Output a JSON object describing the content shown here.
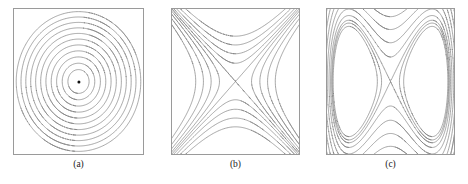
{
  "figure": {
    "width": 468,
    "height": 184,
    "background": "#ffffff",
    "contour_color": "#808080",
    "frame_color": "#9a9a9a",
    "caption_color": "#1a1a1a",
    "marker_color": "#111111",
    "line_width": 0.7
  },
  "panels": [
    {
      "id": "a",
      "caption": "(a)",
      "name": "panel-a-center-contours",
      "x": 13,
      "y": 8,
      "width": 131,
      "height": 147,
      "caption_y": 160,
      "field_type": "center",
      "description": "concentric closed contours around an elliptic fixed point (minimum)",
      "marker": {
        "visible": true,
        "cx": 0.5,
        "cy": 0.5,
        "r": 1.6
      },
      "levels": [
        0.055,
        0.13,
        0.235,
        0.365,
        0.52,
        0.7,
        0.9,
        1.12,
        1.36,
        1.62,
        1.9
      ],
      "domain": {
        "xmin": -1.45,
        "xmax": 1.45,
        "ymin": -1.45,
        "ymax": 1.45
      }
    },
    {
      "id": "b",
      "caption": "(b)",
      "name": "panel-b-saddle-contours",
      "x": 171,
      "y": 8,
      "width": 129,
      "height": 147,
      "caption_y": 160,
      "field_type": "saddle",
      "description": "hyperbolic contours about a saddle point with X-shaped separatrix",
      "marker": {
        "visible": false
      },
      "levels": [
        -0.8,
        -0.52,
        -0.3,
        -0.13,
        0.0,
        0.13,
        0.3,
        0.52,
        0.8
      ],
      "domain": {
        "xmin": -1.45,
        "xmax": 1.45,
        "ymin": -1.45,
        "ymax": 1.45
      }
    },
    {
      "id": "c",
      "caption": "(c)",
      "name": "panel-c-double-well-contours",
      "x": 326,
      "y": 8,
      "width": 129,
      "height": 147,
      "caption_y": 160,
      "field_type": "double-well",
      "description": "figure-eight separatrix of a double well with nested outer contours",
      "marker": {
        "visible": false
      },
      "levels": [
        -0.19,
        -0.09,
        0.0,
        0.16,
        0.4,
        0.72,
        1.12,
        1.6,
        2.16
      ],
      "domain": {
        "xmin": -1.55,
        "xmax": 1.55,
        "ymin": -1.2,
        "ymax": 1.2
      }
    }
  ],
  "chart_data": {
    "type": "contour",
    "title": "",
    "panel_count": 3,
    "panels": [
      {
        "label": "(a)",
        "kind": "elliptic-center",
        "formula": "f(x,y) = x^2 + y^2",
        "level_count": 11,
        "levels": [
          0.055,
          0.13,
          0.235,
          0.365,
          0.52,
          0.7,
          0.9,
          1.12,
          1.36,
          1.62,
          1.9
        ],
        "fixed_point": {
          "x": 0,
          "y": 0,
          "type": "center",
          "marked": true
        },
        "xlim": [
          -1.45,
          1.45
        ],
        "ylim": [
          -1.45,
          1.45
        ],
        "grid": false,
        "legend": "none"
      },
      {
        "label": "(b)",
        "kind": "saddle",
        "formula": "f(x,y) = x^2 - y^2",
        "level_count": 9,
        "levels": [
          -0.8,
          -0.52,
          -0.3,
          -0.13,
          0.0,
          0.13,
          0.3,
          0.52,
          0.8
        ],
        "fixed_point": {
          "x": 0,
          "y": 0,
          "type": "saddle",
          "marked": false
        },
        "xlim": [
          -1.45,
          1.45
        ],
        "ylim": [
          -1.45,
          1.45
        ],
        "grid": false,
        "legend": "none"
      },
      {
        "label": "(c)",
        "kind": "double-well",
        "formula": "f(x,y) = (x^2 - 1)^2 + y^2",
        "level_count": 9,
        "levels": [
          -0.19,
          -0.09,
          0.0,
          0.16,
          0.4,
          0.72,
          1.12,
          1.6,
          2.16
        ],
        "fixed_points": [
          {
            "x": -1,
            "y": 0,
            "type": "center",
            "marked": false
          },
          {
            "x": 0,
            "y": 0,
            "type": "saddle",
            "marked": false
          },
          {
            "x": 1,
            "y": 0,
            "type": "center",
            "marked": false
          }
        ],
        "xlim": [
          -1.55,
          1.55
        ],
        "ylim": [
          -1.2,
          1.2
        ],
        "grid": false,
        "legend": "none"
      }
    ]
  }
}
